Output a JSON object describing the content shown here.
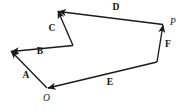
{
  "figure": {
    "type": "vector-polygon-diagram",
    "background_color": "#ffffff",
    "stroke_color": "#1a1a1a",
    "label_color": "#121212",
    "width": 187,
    "height": 111,
    "points": [
      {
        "name": "O",
        "label": "O",
        "x": 47,
        "y": 88,
        "label_x": 46.5,
        "label_y": 98.5,
        "style": "italic"
      },
      {
        "name": "P",
        "label": "P",
        "x": 163,
        "y": 24.5,
        "label_x": 173,
        "label_y": 23,
        "style": "italic"
      },
      {
        "name": "tip-A",
        "label": "",
        "x": 11,
        "y": 51
      },
      {
        "name": "joint-BC",
        "label": "",
        "x": 73,
        "y": 45.5
      },
      {
        "name": "apex-CD",
        "label": "",
        "x": 58,
        "y": 11
      },
      {
        "name": "foot-F",
        "label": "",
        "x": 157,
        "y": 62
      }
    ],
    "vectors": [
      {
        "name": "A",
        "label": "A",
        "from_x": 47,
        "from_y": 88,
        "to_x": 11,
        "to_y": 51,
        "label_x": 26,
        "label_y": 76
      },
      {
        "name": "B",
        "label": "B",
        "from_x": 73,
        "from_y": 45.5,
        "to_x": 11.5,
        "to_y": 51.5,
        "label_x": 40,
        "label_y": 52
      },
      {
        "name": "C",
        "label": "C",
        "from_x": 73,
        "from_y": 45.5,
        "to_x": 58,
        "to_y": 11,
        "label_x": 52,
        "label_y": 28.5
      },
      {
        "name": "D",
        "label": "D",
        "from_x": 163,
        "from_y": 24.5,
        "to_x": 58.5,
        "to_y": 11.5,
        "label_x": 116,
        "label_y": 8
      },
      {
        "name": "E",
        "label": "E",
        "from_x": 157,
        "from_y": 62,
        "to_x": 48,
        "to_y": 88,
        "label_x": 110,
        "label_y": 83
      },
      {
        "name": "F",
        "label": "F",
        "from_x": 157,
        "from_y": 62,
        "to_x": 163,
        "to_y": 25,
        "label_x": 168,
        "label_y": 45
      }
    ],
    "tick_marks": [
      {
        "name": "tick-at-P",
        "x": 163,
        "y": 24.5
      }
    ]
  }
}
